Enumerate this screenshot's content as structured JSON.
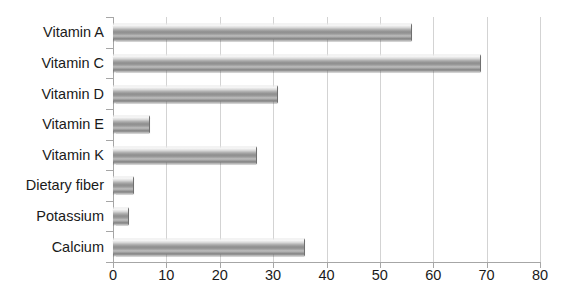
{
  "chart_data": {
    "type": "bar",
    "orientation": "horizontal",
    "title": "",
    "xlabel": "",
    "ylabel": "",
    "categories": [
      "Vitamin A",
      "Vitamin C",
      "Vitamin D",
      "Vitamin E",
      "Vitamin K",
      "Dietary fiber",
      "Potassium",
      "Calcium"
    ],
    "values": [
      56,
      69,
      31,
      7,
      27,
      4,
      3,
      36
    ],
    "xlim": [
      0,
      80
    ],
    "xticks": [
      0,
      10,
      20,
      30,
      40,
      50,
      60,
      70,
      80
    ],
    "xtick_labels": [
      "0",
      "10",
      "20",
      "30",
      "40",
      "50",
      "60",
      "70",
      "80"
    ],
    "grid": "vertical",
    "legend": "none",
    "series": [
      {
        "name": "Series 1",
        "values": [
          56,
          69,
          31,
          7,
          27,
          4,
          3,
          36
        ]
      }
    ]
  },
  "style": {
    "bar_fill_light": "#f2f2f2",
    "bar_fill_mid": "#8e8e8e",
    "bar_edge": "#6f6f6f",
    "gridline_color": "#d3d3d3",
    "axis_color": "#a6a6a6",
    "text_color": "#1a1a1a",
    "background": "#ffffff"
  }
}
